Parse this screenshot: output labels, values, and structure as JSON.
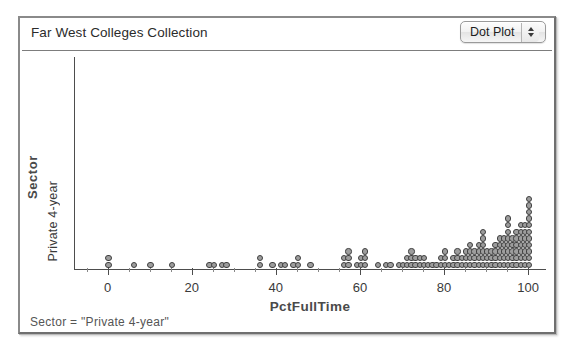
{
  "window": {
    "collection_title": "Far West Colleges Collection",
    "plot_type_menu": {
      "selected": "Dot Plot",
      "options": [
        "Dot Plot",
        "Histogram",
        "Box Plot",
        "Scatter Plot"
      ],
      "stepper_up_icon": "triangle-up-icon",
      "stepper_down_icon": "triangle-down-icon"
    }
  },
  "graph": {
    "x_axis_title": "PctFullTime",
    "y_axis_title": "Sector",
    "y_axis_category": "Private 4-year",
    "x_tick_labels": [
      "0",
      "20",
      "40",
      "60",
      "80",
      "100"
    ]
  },
  "status": {
    "filter_text": "Sector = \"Private  4-year\""
  },
  "colors": {
    "dot_fill": "#9d9d9d",
    "dot_stroke": "#3f3f3f",
    "axis": "#4d4d4d",
    "text": "#3a3a3a",
    "axis_title": "#4a4a4a",
    "window_border": "#8a8a8a"
  },
  "chart_data": {
    "type": "scatter",
    "plot_style": "dot-plot",
    "title": "Far West Colleges Collection",
    "xlabel": "PctFullTime",
    "ylabel": "Sector",
    "y_category": "Private 4-year",
    "xlim": [
      -8,
      104
    ],
    "xticks": [
      0,
      20,
      40,
      60,
      80,
      100
    ],
    "xticks_minor_step": 5,
    "grid": false,
    "legend": null,
    "annotation": "Sector = \"Private  4-year\"",
    "note": "Stacked dot plot: each value is a PctFullTime reading; count is the number of colleges sharing that value (dots stack vertically).",
    "value_counts": [
      {
        "x": 0,
        "count": 2
      },
      {
        "x": 6,
        "count": 1
      },
      {
        "x": 10,
        "count": 1
      },
      {
        "x": 15,
        "count": 1
      },
      {
        "x": 24,
        "count": 1
      },
      {
        "x": 25,
        "count": 1
      },
      {
        "x": 27,
        "count": 1
      },
      {
        "x": 28,
        "count": 1
      },
      {
        "x": 36,
        "count": 2
      },
      {
        "x": 39,
        "count": 1
      },
      {
        "x": 41,
        "count": 1
      },
      {
        "x": 42,
        "count": 1
      },
      {
        "x": 44,
        "count": 1
      },
      {
        "x": 45,
        "count": 2
      },
      {
        "x": 48,
        "count": 1
      },
      {
        "x": 56,
        "count": 2
      },
      {
        "x": 57,
        "count": 3
      },
      {
        "x": 59,
        "count": 1
      },
      {
        "x": 60,
        "count": 2
      },
      {
        "x": 61,
        "count": 3
      },
      {
        "x": 64,
        "count": 1
      },
      {
        "x": 66,
        "count": 1
      },
      {
        "x": 67,
        "count": 1
      },
      {
        "x": 69,
        "count": 1
      },
      {
        "x": 70,
        "count": 1
      },
      {
        "x": 71,
        "count": 2
      },
      {
        "x": 72,
        "count": 3
      },
      {
        "x": 73,
        "count": 2
      },
      {
        "x": 74,
        "count": 2
      },
      {
        "x": 75,
        "count": 2
      },
      {
        "x": 76,
        "count": 1
      },
      {
        "x": 77,
        "count": 1
      },
      {
        "x": 78,
        "count": 1
      },
      {
        "x": 79,
        "count": 2
      },
      {
        "x": 80,
        "count": 3
      },
      {
        "x": 81,
        "count": 1
      },
      {
        "x": 82,
        "count": 2
      },
      {
        "x": 83,
        "count": 3
      },
      {
        "x": 84,
        "count": 2
      },
      {
        "x": 85,
        "count": 3
      },
      {
        "x": 86,
        "count": 4
      },
      {
        "x": 87,
        "count": 3
      },
      {
        "x": 88,
        "count": 4
      },
      {
        "x": 89,
        "count": 6
      },
      {
        "x": 90,
        "count": 3
      },
      {
        "x": 91,
        "count": 3
      },
      {
        "x": 92,
        "count": 4
      },
      {
        "x": 93,
        "count": 5
      },
      {
        "x": 94,
        "count": 5
      },
      {
        "x": 95,
        "count": 8
      },
      {
        "x": 96,
        "count": 5
      },
      {
        "x": 97,
        "count": 6
      },
      {
        "x": 98,
        "count": 7
      },
      {
        "x": 99,
        "count": 7
      },
      {
        "x": 100,
        "count": 11
      }
    ]
  }
}
